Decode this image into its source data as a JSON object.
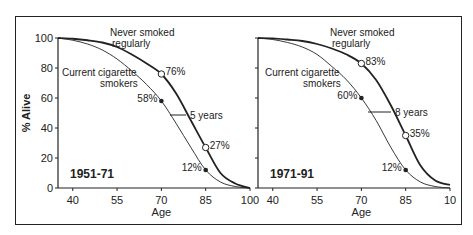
{
  "chart_data": [
    {
      "type": "line",
      "title": "1951-71",
      "xlabel": "Age",
      "ylabel": "% Alive",
      "xlim": [
        35,
        100
      ],
      "ylim": [
        0,
        100
      ],
      "xticks": [
        40,
        55,
        70,
        85,
        100
      ],
      "yticks": [
        0,
        20,
        40,
        60,
        80,
        100
      ],
      "grid": false,
      "series": [
        {
          "name": "Never smoked regularly",
          "x": [
            35,
            40,
            45,
            50,
            55,
            60,
            65,
            70,
            75,
            80,
            85,
            90,
            95,
            100
          ],
          "values": [
            100,
            99.5,
            98.5,
            97,
            94,
            89,
            83,
            76,
            63,
            45,
            27,
            10,
            3,
            0
          ]
        },
        {
          "name": "Current cigarette smokers",
          "x": [
            35,
            40,
            45,
            50,
            55,
            60,
            65,
            70,
            75,
            80,
            85,
            90,
            95,
            100
          ],
          "values": [
            100,
            98.5,
            96,
            92,
            86,
            78,
            69,
            58,
            43,
            27,
            12,
            4,
            1,
            0
          ]
        }
      ],
      "annotations": [
        {
          "text": "76%",
          "age": 70,
          "value": 76,
          "marker": "open-circle"
        },
        {
          "text": "58%",
          "age": 70,
          "value": 58,
          "marker": "filled-circle"
        },
        {
          "text": "27%",
          "age": 85,
          "value": 27,
          "marker": "open-circle"
        },
        {
          "text": "12%",
          "age": 85,
          "value": 12,
          "marker": "filled-circle"
        },
        {
          "text": "5 years",
          "type": "gap-label"
        }
      ]
    },
    {
      "type": "line",
      "title": "1971-91",
      "xlabel": "Age",
      "ylabel": "% Alive",
      "xlim": [
        35,
        100
      ],
      "ylim": [
        0,
        100
      ],
      "xticks": [
        40,
        55,
        70,
        85,
        100
      ],
      "yticks": [
        0,
        20,
        40,
        60,
        80,
        100
      ],
      "grid": false,
      "series": [
        {
          "name": "Never smoked regularly",
          "x": [
            35,
            40,
            45,
            50,
            55,
            60,
            65,
            70,
            75,
            80,
            85,
            90,
            95,
            100
          ],
          "values": [
            100,
            99.8,
            99,
            98,
            96,
            93,
            89,
            83,
            72,
            55,
            35,
            15,
            5,
            2
          ]
        },
        {
          "name": "Current cigarette smokers",
          "x": [
            35,
            40,
            45,
            50,
            55,
            60,
            65,
            70,
            75,
            80,
            85,
            90,
            95,
            100
          ],
          "values": [
            100,
            99,
            97,
            94,
            89,
            81,
            72,
            60,
            45,
            27,
            12,
            4,
            1,
            0
          ]
        }
      ],
      "annotations": [
        {
          "text": "83%",
          "age": 70,
          "value": 83,
          "marker": "open-circle"
        },
        {
          "text": "60%",
          "age": 70,
          "value": 60,
          "marker": "filled-circle"
        },
        {
          "text": "35%",
          "age": 85,
          "value": 35,
          "marker": "open-circle"
        },
        {
          "text": "12%",
          "age": 85,
          "value": 12,
          "marker": "filled-circle"
        },
        {
          "text": "8 years",
          "type": "gap-label"
        }
      ]
    }
  ],
  "labels": {
    "never_1": "Never smoked",
    "never_2": "regularly",
    "smokers_1": "Current cigarette",
    "smokers_2": "smokers",
    "ylabel": "% Alive",
    "xlabel": "Age",
    "period_left": "1951-71",
    "period_right": "1971-91",
    "gap_left": "5 years",
    "gap_right": "8 years",
    "last_tick_right": "10"
  }
}
